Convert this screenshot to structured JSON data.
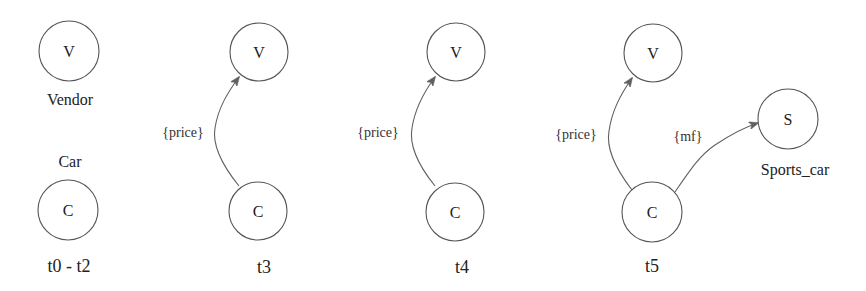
{
  "diagram": {
    "colors": {
      "stroke": "#555555",
      "text": "#222222",
      "background": "#ffffff"
    },
    "panels": [
      {
        "time_label": "t0 - t2",
        "nodes": [
          {
            "letter": "V",
            "label": "Vendor"
          },
          {
            "letter": "C",
            "label": "Car"
          }
        ],
        "edges": []
      },
      {
        "time_label": "t3",
        "nodes": [
          {
            "letter": "V"
          },
          {
            "letter": "C"
          }
        ],
        "edges": [
          {
            "from": "C",
            "to": "V",
            "label": "{price}"
          }
        ]
      },
      {
        "time_label": "t4",
        "nodes": [
          {
            "letter": "V"
          },
          {
            "letter": "C"
          }
        ],
        "edges": [
          {
            "from": "C",
            "to": "V",
            "label": "{price}"
          }
        ]
      },
      {
        "time_label": "t5",
        "nodes": [
          {
            "letter": "V"
          },
          {
            "letter": "C"
          },
          {
            "letter": "S",
            "label": "Sports_car"
          }
        ],
        "edges": [
          {
            "from": "C",
            "to": "V",
            "label": "{price}"
          },
          {
            "from": "C",
            "to": "S",
            "label": "{mf}"
          }
        ]
      }
    ]
  }
}
